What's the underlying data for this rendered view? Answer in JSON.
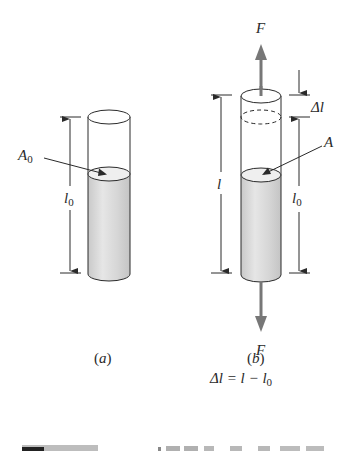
{
  "figure": {
    "panel_a": {
      "caption": "(a)",
      "area_label": "A",
      "area_subscript": "0",
      "length_label": "l",
      "length_subscript": "0"
    },
    "panel_b": {
      "caption": "(b)",
      "force_top_label": "F",
      "force_bottom_label": "F",
      "area_label": "A",
      "delta_label": "Δl",
      "length_label": "l",
      "orig_length_label": "l",
      "orig_length_subscript": "0",
      "equation_lhs": "Δl = l − l",
      "equation_subscript": "0"
    },
    "colors": {
      "line": "#2a2a2a",
      "fill": "#d9d9d9",
      "fill_top": "#ececec",
      "arrow": "#777777"
    }
  }
}
